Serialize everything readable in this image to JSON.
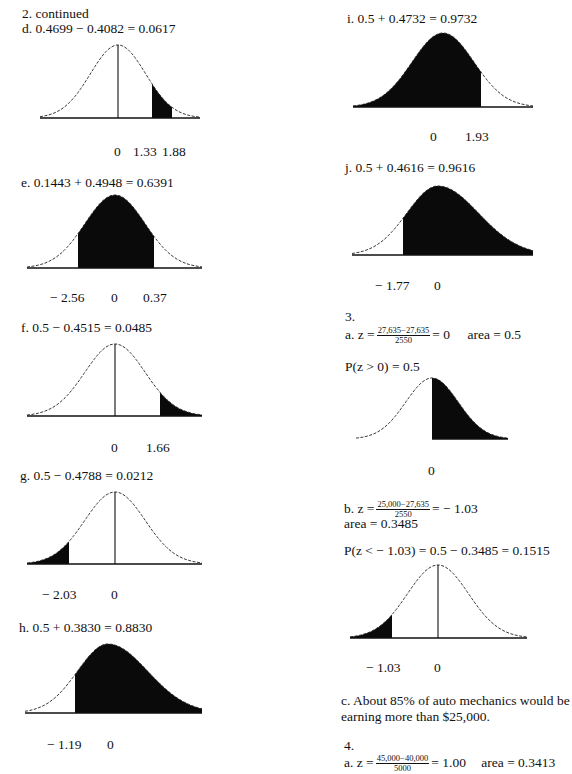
{
  "page": {
    "header": "2. continued",
    "problems_2": [
      {
        "id": "d",
        "equation": "d.  0.4699 − 0.4082 = 0.0617",
        "labels": [
          "0",
          "1.33",
          "1.88"
        ]
      },
      {
        "id": "e",
        "equation": "e.  0.1443 + 0.4948 = 0.6391",
        "labels": [
          "− 2.56",
          "0",
          "0.37"
        ]
      },
      {
        "id": "f",
        "equation": "f.  0.5 − 0.4515 = 0.0485",
        "labels": [
          "0",
          "1.66"
        ]
      },
      {
        "id": "g",
        "equation": "g.  0.5 − 0.4788 = 0.0212",
        "labels": [
          "− 2.03",
          "0"
        ]
      },
      {
        "id": "h",
        "equation": "h.  0.5 + 0.3830 = 0.8830",
        "labels": [
          "− 1.19",
          "0"
        ]
      },
      {
        "id": "i",
        "equation": "i.  0.5 + 0.4732 = 0.9732",
        "labels": [
          "0",
          "1.93"
        ]
      },
      {
        "id": "j",
        "equation": "j.  0.5 + 0.4616 = 0.9616",
        "labels": [
          "− 1.77",
          "0"
        ]
      }
    ],
    "problem_3": {
      "number": "3.",
      "a": {
        "prefix": "a.  z =",
        "frac_num": "27,635−27,635",
        "frac_den": "2550",
        "suffix": "= 0",
        "area": "area = 0.5",
        "prob": "P(z > 0) = 0.5",
        "labels": [
          "0"
        ]
      },
      "b": {
        "prefix": "b.  z =",
        "frac_num": "25,000−27,635",
        "frac_den": "2550",
        "suffix": "=  − 1.03",
        "area": "area = 0.3485",
        "prob": "P(z <  − 1.03) = 0.5 − 0.3485 = 0.1515",
        "labels": [
          "− 1.03",
          "0"
        ]
      },
      "c": {
        "line1": "c.  About 85% of auto mechanics would be",
        "line2": "earning more than $25,000."
      }
    },
    "problem_4": {
      "number": "4.",
      "a": {
        "prefix": "a.  z =",
        "frac_num": "45,000−40,000",
        "frac_den": "5000",
        "suffix": "= 1.00",
        "area": "area = 0.3413"
      }
    }
  },
  "curves": [
    {
      "id": "d",
      "x0": 40,
      "x1": 200,
      "base": 118,
      "peak": 45,
      "mean": 118,
      "skew": 0,
      "shade": [
        152,
        172
      ],
      "center_line": true
    },
    {
      "id": "e",
      "x0": 27,
      "x1": 202,
      "base": 268,
      "peak": 195,
      "mean": 115,
      "skew": 0,
      "shade": [
        78,
        154
      ],
      "center_line": false
    },
    {
      "id": "f",
      "x0": 27,
      "x1": 202,
      "base": 416,
      "peak": 344,
      "mean": 115,
      "skew": 0,
      "shade": [
        160,
        202
      ],
      "center_line": true
    },
    {
      "id": "g",
      "x0": 27,
      "x1": 202,
      "base": 564,
      "peak": 492,
      "mean": 115,
      "skew": 0,
      "shade": [
        27,
        69
      ],
      "center_line": true
    },
    {
      "id": "h",
      "x0": 25,
      "x1": 202,
      "base": 713,
      "peak": 644,
      "mean": 108,
      "skew": 0.3,
      "shade": [
        75,
        202
      ],
      "center_line": false
    },
    {
      "id": "i",
      "x0": 353,
      "x1": 533,
      "base": 107,
      "peak": 33,
      "mean": 443,
      "skew": 0,
      "shade": [
        353,
        481
      ],
      "center_line": false
    },
    {
      "id": "j",
      "x0": 352,
      "x1": 533,
      "base": 255,
      "peak": 186,
      "mean": 438,
      "skew": 0.3,
      "shade": [
        403,
        533
      ],
      "center_line": false
    },
    {
      "id": "3a",
      "x0": 356,
      "x1": 508,
      "base": 439,
      "peak": 378,
      "mean": 432,
      "skew": 0,
      "shade": [
        432,
        508
      ],
      "center_line": false,
      "no_baseline_left": true
    },
    {
      "id": "3b",
      "x0": 350,
      "x1": 527,
      "base": 638,
      "peak": 565,
      "mean": 438,
      "skew": 0,
      "shade": [
        350,
        392
      ],
      "center_line": true
    }
  ]
}
